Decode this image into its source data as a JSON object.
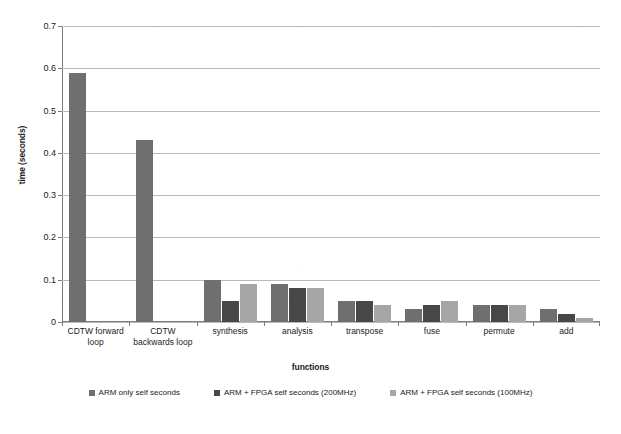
{
  "chart_data": {
    "type": "bar",
    "title": "",
    "xlabel": "functions",
    "ylabel": "time (seconds)",
    "ylim": [
      0,
      0.7
    ],
    "ytick_labels": [
      "0",
      "0.1",
      "0.2",
      "0.3",
      "0.4",
      "0.5",
      "0.6",
      "0.7"
    ],
    "ytick_values": [
      0,
      0.1,
      0.2,
      0.3,
      0.4,
      0.5,
      0.6,
      0.7
    ],
    "grid": true,
    "legend_position": "bottom",
    "categories": [
      "CDTW forward loop",
      "CDTW backwards loop",
      "synthesis",
      "analysis",
      "transpose",
      "fuse",
      "permute",
      "add"
    ],
    "series": [
      {
        "name": "ARM only self seconds",
        "color": "#6f6f6f",
        "values": [
          0.59,
          0.43,
          0.1,
          0.09,
          0.05,
          0.03,
          0.04,
          0.03
        ]
      },
      {
        "name": "ARM + FPGA self seconds (200MHz)",
        "color": "#474747",
        "values": [
          0,
          0,
          0.05,
          0.08,
          0.05,
          0.04,
          0.04,
          0.02
        ]
      },
      {
        "name": "ARM + FPGA self seconds (100MHz)",
        "color": "#a6a6a6",
        "values": [
          0,
          0,
          0.09,
          0.08,
          0.04,
          0.05,
          0.04,
          0.01
        ]
      }
    ]
  },
  "axes": {
    "y_title": "time (seconds)",
    "x_title": "functions"
  },
  "legend": {
    "items": [
      {
        "label": "ARM only self seconds",
        "color": "#6f6f6f"
      },
      {
        "label": "ARM + FPGA self seconds (200MHz)",
        "color": "#474747"
      },
      {
        "label": "ARM + FPGA self seconds (100MHz)",
        "color": "#a6a6a6"
      }
    ]
  }
}
